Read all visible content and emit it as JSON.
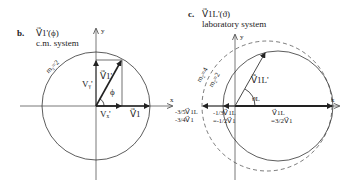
{
  "panel_b": {
    "letter": "b.",
    "title": "V⃗1'(ϕ)",
    "subtitle": "c.m. system",
    "axis_x": "x",
    "axis_y": "y",
    "circle_label": "m₂=2",
    "vector_v1prime": "V⃗1'",
    "vy_label": "Vᵧ'",
    "vx_label": "Vₓ'",
    "v1_label": "V⃗1",
    "angle_label": "ϕ"
  },
  "panel_c": {
    "letter": "c.",
    "title": "V⃗1L'(ϑ)",
    "subtitle": "laboratory system",
    "axis_x": "x",
    "axis_y": "y",
    "circle_label_solid": "m₂=2",
    "circle_label_dashed": "m₂=4",
    "vector_label": "V⃗1L'",
    "angle_label": "ϑL",
    "left_outer_1": "-3/5V⃗1L",
    "left_outer_2": "-3/4V⃗1",
    "left_inner_1": "-1/3V⃗1L",
    "left_inner_2": "=-1/2V⃗1",
    "right_1": "V⃗1L",
    "right_2": "=3/2V⃗1"
  },
  "colors": {
    "line": "#333333",
    "axis": "#555555"
  }
}
